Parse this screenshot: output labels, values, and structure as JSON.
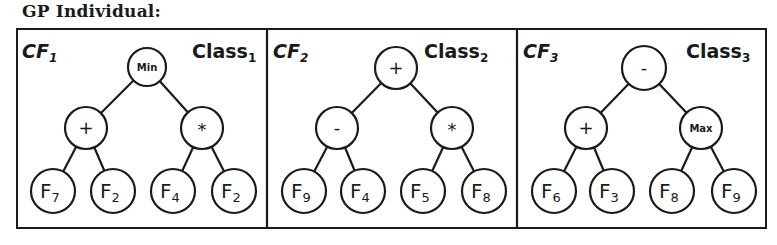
{
  "title": "GP Individual:",
  "colors": {
    "ink": "#1a1a1a",
    "background": "#ffffff"
  },
  "panels": [
    {
      "cf_label": "CF",
      "cf_sub": "1",
      "class_label": "Class",
      "class_sub": "1",
      "root": "Min",
      "left": "+",
      "right": "*",
      "leaves": [
        {
          "name": "F",
          "sub": "7"
        },
        {
          "name": "F",
          "sub": "2"
        },
        {
          "name": "F",
          "sub": "4"
        },
        {
          "name": "F",
          "sub": "2"
        }
      ]
    },
    {
      "cf_label": "CF",
      "cf_sub": "2",
      "class_label": "Class",
      "class_sub": "2",
      "root": "+",
      "left": "-",
      "right": "*",
      "leaves": [
        {
          "name": "F",
          "sub": "9"
        },
        {
          "name": "F",
          "sub": "4"
        },
        {
          "name": "F",
          "sub": "5"
        },
        {
          "name": "F",
          "sub": "8"
        }
      ]
    },
    {
      "cf_label": "CF",
      "cf_sub": "3",
      "class_label": "Class",
      "class_sub": "3",
      "root": "-",
      "left": "+",
      "right": "Max",
      "leaves": [
        {
          "name": "F",
          "sub": "6"
        },
        {
          "name": "F",
          "sub": "3"
        },
        {
          "name": "F",
          "sub": "8"
        },
        {
          "name": "F",
          "sub": "9"
        }
      ]
    }
  ]
}
